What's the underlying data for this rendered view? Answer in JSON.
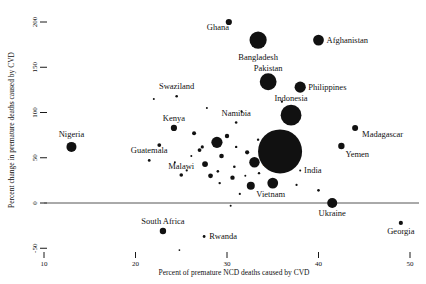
{
  "chart_data": {
    "type": "scatter",
    "title": "",
    "subtitle": "",
    "xlabel": "Percent of premature NCD deaths caused by CVD",
    "ylabel": "Percent change in premature deaths caused by CVD",
    "xlim": [
      8,
      52
    ],
    "ylim": [
      -60,
      215
    ],
    "xticks": [
      10,
      20,
      30,
      40,
      50
    ],
    "yticks": [
      -50,
      0,
      50,
      100,
      150,
      200
    ],
    "xticklabels": [
      "10",
      "20",
      "30",
      "40",
      "50"
    ],
    "yticklabels": [
      "-50",
      "0",
      "50",
      "100",
      "150",
      "200"
    ],
    "grid": false,
    "legend": false,
    "zero_reference_line": 0,
    "marker_color": "#111111",
    "size_note": "bubble radius encodes number of premature CVD deaths",
    "points": [
      {
        "label": "Ghana",
        "x": 30.2,
        "y": 200.0,
        "r": 3.1,
        "lx": -22,
        "ly": 8,
        "anchor": "start"
      },
      {
        "label": "Bangladesh",
        "x": 33.4,
        "y": 180.0,
        "r": 8.6,
        "lx": 0,
        "ly": 20,
        "anchor": "middle"
      },
      {
        "label": "Afghanistan",
        "x": 40.0,
        "y": 180.0,
        "r": 5.4,
        "lx": 8,
        "ly": 3,
        "anchor": "start"
      },
      {
        "label": "Pakistan",
        "x": 34.5,
        "y": 134.0,
        "r": 8.4,
        "lx": 0,
        "ly": -11,
        "anchor": "middle"
      },
      {
        "label": "Philippines",
        "x": 38.0,
        "y": 128.0,
        "r": 5.6,
        "lx": 8,
        "ly": 3,
        "anchor": "start"
      },
      {
        "label": "Swaziland",
        "x": 24.5,
        "y": 118.0,
        "r": 1.3,
        "lx": 0,
        "ly": -7,
        "anchor": "middle"
      },
      {
        "label": "Indonesia",
        "x": 37.0,
        "y": 97.0,
        "r": 10.4,
        "lx": 0,
        "ly": -14,
        "anchor": "middle"
      },
      {
        "label": "Kenya",
        "x": 24.2,
        "y": 83.0,
        "r": 3.1,
        "lx": 0,
        "ly": -7,
        "anchor": "middle"
      },
      {
        "label": "Namibia",
        "x": 31.0,
        "y": 89.0,
        "r": 1.3,
        "lx": 0,
        "ly": -6,
        "anchor": "middle"
      },
      {
        "label": "Madagascar",
        "x": 44.0,
        "y": 83.0,
        "r": 3.0,
        "lx": 7,
        "ly": 9,
        "anchor": "start"
      },
      {
        "label": "Nigeria",
        "x": 13.0,
        "y": 62.0,
        "r": 5.0,
        "lx": 0,
        "ly": -10,
        "anchor": "middle"
      },
      {
        "label": "India",
        "x": 35.8,
        "y": 57.0,
        "r": 22.0,
        "lx": 24,
        "ly": 22,
        "anchor": "start"
      },
      {
        "label": "Yemen",
        "x": 42.5,
        "y": 63.0,
        "r": 3.2,
        "lx": 4,
        "ly": 11,
        "anchor": "start"
      },
      {
        "label": "Guatemala",
        "x": 21.5,
        "y": 47.0,
        "r": 1.4,
        "lx": 0,
        "ly": -7,
        "anchor": "middle"
      },
      {
        "label": "Myanmar",
        "x": 33.0,
        "y": 45.0,
        "r": 5.2,
        "lx": 8,
        "ly": 4,
        "anchor": "start"
      },
      {
        "label": "Malawi",
        "x": 25.0,
        "y": 31.0,
        "r": 1.8,
        "lx": 0,
        "ly": -6,
        "anchor": "middle"
      },
      {
        "label": "Vietnam",
        "x": 35.0,
        "y": 22.0,
        "r": 5.4,
        "lx": -2,
        "ly": 14,
        "anchor": "middle"
      },
      {
        "label": "Ukraine",
        "x": 41.5,
        "y": 0.0,
        "r": 5.0,
        "lx": 0,
        "ly": 13,
        "anchor": "middle"
      },
      {
        "label": "South Africa",
        "x": 23.0,
        "y": -31.0,
        "r": 3.2,
        "lx": 0,
        "ly": -7,
        "anchor": "middle"
      },
      {
        "label": "Rwanda",
        "x": 27.5,
        "y": -37.0,
        "r": 1.4,
        "lx": 5,
        "ly": 3,
        "anchor": "start"
      },
      {
        "label": "Georgia",
        "x": 49.0,
        "y": -22.0,
        "r": 2.1,
        "lx": 0,
        "ly": 11,
        "anchor": "middle"
      }
    ],
    "unlabeled_points": [
      {
        "x": 22.0,
        "y": 115.0,
        "r": 1.0
      },
      {
        "x": 36.0,
        "y": 112.0,
        "r": 1.1
      },
      {
        "x": 27.8,
        "y": 105.0,
        "r": 1.0
      },
      {
        "x": 31.6,
        "y": 101.0,
        "r": 1.1
      },
      {
        "x": 26.4,
        "y": 77.0,
        "r": 2.0
      },
      {
        "x": 30.0,
        "y": 74.0,
        "r": 2.2
      },
      {
        "x": 28.9,
        "y": 67.0,
        "r": 5.6
      },
      {
        "x": 22.6,
        "y": 64.0,
        "r": 1.9
      },
      {
        "x": 27.3,
        "y": 62.0,
        "r": 1.6
      },
      {
        "x": 27.0,
        "y": 58.5,
        "r": 1.9
      },
      {
        "x": 31.0,
        "y": 62.0,
        "r": 1.2
      },
      {
        "x": 33.4,
        "y": 70.0,
        "r": 1.2
      },
      {
        "x": 26.1,
        "y": 52.0,
        "r": 1.0
      },
      {
        "x": 29.4,
        "y": 52.0,
        "r": 2.3
      },
      {
        "x": 32.2,
        "y": 56.0,
        "r": 2.1
      },
      {
        "x": 24.3,
        "y": 45.0,
        "r": 1.0
      },
      {
        "x": 27.6,
        "y": 43.0,
        "r": 2.9
      },
      {
        "x": 30.8,
        "y": 40.0,
        "r": 1.3
      },
      {
        "x": 36.5,
        "y": 47.0,
        "r": 2.6
      },
      {
        "x": 25.6,
        "y": 36.0,
        "r": 1.1
      },
      {
        "x": 29.0,
        "y": 35.0,
        "r": 1.3
      },
      {
        "x": 28.2,
        "y": 30.0,
        "r": 2.4
      },
      {
        "x": 32.0,
        "y": 30.0,
        "r": 1.0
      },
      {
        "x": 33.5,
        "y": 33.0,
        "r": 1.2
      },
      {
        "x": 30.6,
        "y": 28.0,
        "r": 2.2
      },
      {
        "x": 38.0,
        "y": 36.0,
        "r": 1.0
      },
      {
        "x": 29.2,
        "y": 22.0,
        "r": 1.2
      },
      {
        "x": 32.6,
        "y": 19.0,
        "r": 4.0
      },
      {
        "x": 37.6,
        "y": 20.0,
        "r": 1.1
      },
      {
        "x": 31.4,
        "y": 10.0,
        "r": 1.1
      },
      {
        "x": 40.0,
        "y": 14.0,
        "r": 1.3
      },
      {
        "x": 30.4,
        "y": -3.0,
        "r": 1.0
      },
      {
        "x": 24.8,
        "y": -52.0,
        "r": 0.9
      }
    ]
  },
  "axes": {
    "x_label": "Percent of premature NCD deaths caused by CVD",
    "y_label": "Percent change in premature deaths caused by CVD"
  }
}
